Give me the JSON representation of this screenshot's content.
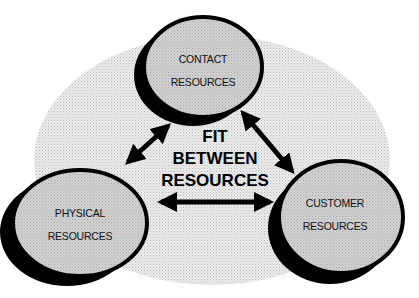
{
  "diagram": {
    "center_title": {
      "line1": "FIT",
      "line2": "BETWEEN",
      "line3": "RESOURCES"
    },
    "nodes": [
      {
        "id": "contact",
        "line1": "CONTACT",
        "line2": "RESOURCES"
      },
      {
        "id": "physical",
        "line1": "PHYSICAL",
        "line2": "RESOURCES"
      },
      {
        "id": "customer",
        "line1": "CUSTOMER",
        "line2": "RESOURCES"
      }
    ],
    "connections": [
      {
        "from": "contact",
        "to": "physical",
        "type": "bidirectional-arrow"
      },
      {
        "from": "contact",
        "to": "customer",
        "type": "bidirectional-arrow"
      },
      {
        "from": "physical",
        "to": "customer",
        "type": "bidirectional-arrow"
      }
    ],
    "colors": {
      "background_ellipse": "#e4e4e4",
      "node_fill": "#cfcfcf",
      "node_border": "#000000",
      "arrow": "#000000"
    }
  }
}
